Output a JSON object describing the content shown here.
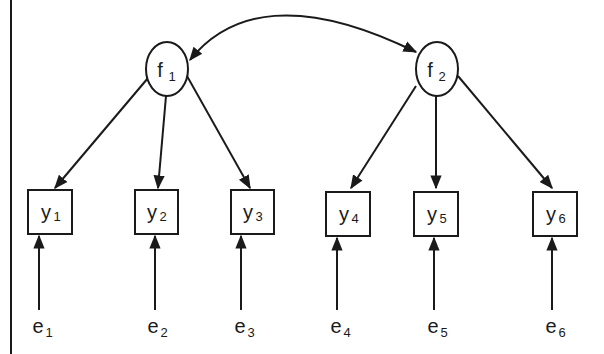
{
  "diagram": {
    "type": "confirmatory factor analysis path diagram",
    "colors": {
      "stroke": "#1a1a1a",
      "background": "#ffffff"
    },
    "latent_factors": [
      {
        "id": "f1",
        "base": "f",
        "sub": "1"
      },
      {
        "id": "f2",
        "base": "f",
        "sub": "2"
      }
    ],
    "observed_indicators": [
      {
        "id": "y1",
        "base": "y",
        "sub": "1",
        "factor": "f1"
      },
      {
        "id": "y2",
        "base": "y",
        "sub": "2",
        "factor": "f1"
      },
      {
        "id": "y3",
        "base": "y",
        "sub": "3",
        "factor": "f1"
      },
      {
        "id": "y4",
        "base": "y",
        "sub": "4",
        "factor": "f2"
      },
      {
        "id": "y5",
        "base": "y",
        "sub": "5",
        "factor": "f2"
      },
      {
        "id": "y6",
        "base": "y",
        "sub": "6",
        "factor": "f2"
      }
    ],
    "errors": [
      {
        "id": "e1",
        "base": "e",
        "sub": "1",
        "target": "y1"
      },
      {
        "id": "e2",
        "base": "e",
        "sub": "2",
        "target": "y2"
      },
      {
        "id": "e3",
        "base": "e",
        "sub": "3",
        "target": "y3"
      },
      {
        "id": "e4",
        "base": "e",
        "sub": "4",
        "target": "y4"
      },
      {
        "id": "e5",
        "base": "e",
        "sub": "5",
        "target": "y5"
      },
      {
        "id": "e6",
        "base": "e",
        "sub": "6",
        "target": "y6"
      }
    ],
    "covariance": {
      "from": "f1",
      "to": "f2",
      "bidirectional": true
    }
  }
}
